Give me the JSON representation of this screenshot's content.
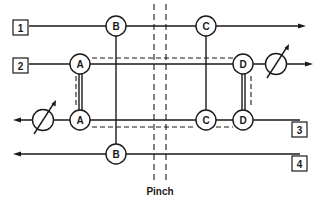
{
  "diagram": {
    "type": "heat-exchanger-network-grid",
    "pinch_label": "Pinch",
    "streams": [
      {
        "id": "1",
        "label": "1",
        "direction": "right",
        "kind": "hot"
      },
      {
        "id": "2",
        "label": "2",
        "direction": "right",
        "kind": "hot"
      },
      {
        "id": "3",
        "label": "3",
        "direction": "left",
        "kind": "cold"
      },
      {
        "id": "4",
        "label": "4",
        "direction": "left",
        "kind": "cold"
      }
    ],
    "exchangers": [
      {
        "id": "A",
        "label": "A",
        "connects": [
          "2",
          "3"
        ]
      },
      {
        "id": "B",
        "label": "B",
        "connects": [
          "1",
          "4"
        ]
      },
      {
        "id": "C",
        "label": "C",
        "connects": [
          "1",
          "3"
        ]
      },
      {
        "id": "D",
        "label": "D",
        "connects": [
          "2",
          "3"
        ]
      }
    ],
    "utilities": [
      {
        "id": "utility-stream-2",
        "on_stream": "2",
        "icon": "adjustable-heater-icon"
      },
      {
        "id": "utility-stream-3",
        "on_stream": "3",
        "icon": "adjustable-heater-icon"
      }
    ],
    "labels": {
      "stream_1": "1",
      "stream_2": "2",
      "stream_3": "3",
      "stream_4": "4",
      "ex_A_top": "A",
      "ex_A_bottom": "A",
      "ex_B_top": "B",
      "ex_B_bottom": "B",
      "ex_C_top": "C",
      "ex_C_bottom": "C",
      "ex_D_top": "D",
      "ex_D_bottom": "D"
    },
    "colors": {
      "ink": "#1a1a1a",
      "background": "#ffffff"
    }
  }
}
